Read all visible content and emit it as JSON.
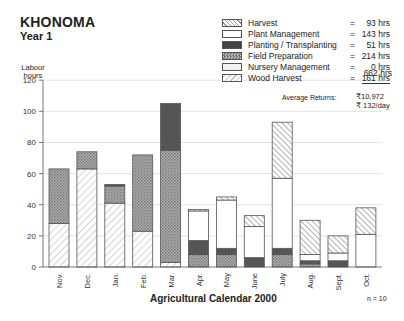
{
  "header": {
    "title": "KHONOMA",
    "subtitle": "Year 1"
  },
  "axis": {
    "ylabel_line1": "Labour",
    "ylabel_line2": "hours",
    "xlabel": "Agricultural Calendar 2000"
  },
  "footnote": "n = 10",
  "legend": {
    "items": [
      {
        "key": "harvest",
        "label": "Harvest",
        "eq": "=",
        "value": "93 hrs"
      },
      {
        "key": "plant",
        "label": "Plant Management",
        "eq": "=",
        "value": "143 hrs"
      },
      {
        "key": "planting",
        "label": "Planting / Transplanting",
        "eq": "=",
        "value": "51 hrs"
      },
      {
        "key": "field",
        "label": "Field Preparation",
        "eq": "=",
        "value": "214 hrs"
      },
      {
        "key": "nursery",
        "label": "Nursery Management",
        "eq": "=",
        "value": "0 hrs"
      },
      {
        "key": "wood",
        "label": "Wood Harvest",
        "eq": "=",
        "value": "161 hrs"
      }
    ],
    "total": "662 hrs",
    "returns_label": "Average Returns:",
    "returns_total": "₹10,972",
    "returns_daily": "₹ 132/day"
  },
  "chart_data": {
    "type": "bar",
    "stacked": true,
    "xlabel": "Agricultural Calendar 2000",
    "ylabel": "Labour hours",
    "ylim": [
      0,
      120
    ],
    "yticks": [
      0,
      20,
      40,
      60,
      80,
      100,
      120
    ],
    "grid": true,
    "legend_position": "top-right",
    "categories": [
      "Nov.",
      "Dec.",
      "Jan.",
      "Feb.",
      "Mar.",
      "Apr.",
      "May",
      "June",
      "July",
      "Aug.",
      "Sept.",
      "Oct."
    ],
    "series": [
      {
        "name": "Wood Harvest",
        "values": [
          28,
          63,
          41,
          23,
          3,
          0,
          0,
          0,
          0,
          0,
          0,
          0
        ]
      },
      {
        "name": "Field Preparation",
        "values": [
          35,
          11,
          11,
          49,
          72,
          8,
          8,
          0,
          8,
          2,
          0,
          0
        ]
      },
      {
        "name": "Planting / Transplanting",
        "values": [
          0,
          0,
          1,
          0,
          30,
          9,
          4,
          6,
          4,
          2,
          4,
          0
        ]
      },
      {
        "name": "Nursery Management",
        "values": [
          0,
          0,
          0,
          0,
          0,
          0,
          0,
          0,
          0,
          0,
          0,
          0
        ]
      },
      {
        "name": "Plant Management",
        "values": [
          0,
          0,
          0,
          0,
          0,
          19,
          31,
          20,
          45,
          4,
          5,
          21
        ]
      },
      {
        "name": "Harvest",
        "values": [
          0,
          0,
          0,
          0,
          0,
          1,
          2,
          7,
          36,
          22,
          11,
          17
        ]
      }
    ],
    "annotations": [
      "n = 10",
      "Average Returns: ₹10,972, ₹132/day"
    ]
  }
}
